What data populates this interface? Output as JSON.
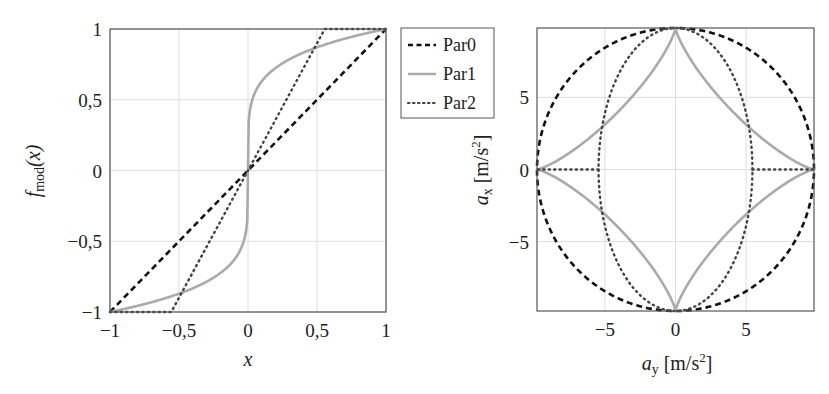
{
  "chart_data": [
    {
      "type": "line",
      "title": "",
      "xlabel": "x",
      "ylabel": "f_mod(x)",
      "xlim": [
        -1,
        1
      ],
      "ylim": [
        -1,
        1
      ],
      "grid": true,
      "xticks": [
        -1,
        -0.5,
        0,
        0.5,
        1
      ],
      "xtick_labels": [
        "−1",
        "−0,5",
        "0",
        "0,5",
        "1"
      ],
      "yticks": [
        -1,
        -0.5,
        0,
        0.5,
        1
      ],
      "ytick_labels": [
        "−1",
        "−0,5",
        "0",
        "0,5",
        "1"
      ],
      "series": [
        {
          "name": "Par0",
          "style": "dashed",
          "color": "#111111",
          "x": [
            -1,
            0,
            1
          ],
          "y": [
            -1,
            0,
            1
          ]
        },
        {
          "name": "Par1",
          "style": "solid",
          "color": "#aaaaaa",
          "x": [
            -1,
            -0.5,
            -0.1,
            -0.01,
            0,
            0.01,
            0.1,
            0.5,
            1
          ],
          "y": [
            -1,
            -0.87,
            -0.63,
            -0.4,
            0,
            0.4,
            0.63,
            0.87,
            1
          ]
        },
        {
          "name": "Par2",
          "style": "dotted",
          "color": "#444444",
          "x": [
            -1,
            -0.556,
            0.556,
            1
          ],
          "y": [
            -1,
            -1,
            1,
            1
          ]
        }
      ]
    },
    {
      "type": "line",
      "title": "",
      "xlabel": "a_y [m/s^2]",
      "ylabel": "a_x [m/s^2]",
      "xlim": [
        -9.81,
        9.81
      ],
      "ylim": [
        -9.81,
        9.81
      ],
      "grid": true,
      "xticks": [
        -5,
        0,
        5
      ],
      "xtick_labels": [
        "−5",
        "0",
        "5"
      ],
      "yticks": [
        -5,
        0,
        5
      ],
      "ytick_labels": [
        "−5",
        "0",
        "5"
      ],
      "series": [
        {
          "name": "Par0",
          "style": "dashed",
          "color": "#111111",
          "shape": "circle",
          "radius": 9.81
        },
        {
          "name": "Par1",
          "style": "solid",
          "color": "#aaaaaa",
          "shape": "superellipse",
          "radius": 9.81,
          "exponent": 0.78
        },
        {
          "name": "Par2",
          "style": "dotted",
          "color": "#444444",
          "shape": "ellipse_with_spurs",
          "semi_axis_y": 5.45,
          "semi_axis_x": 9.81,
          "spur_to": 9.81
        }
      ]
    }
  ],
  "legend": {
    "position": "between plots, top",
    "entries": [
      {
        "label": "Par0",
        "style": "dashed"
      },
      {
        "label": "Par1",
        "style": "solid"
      },
      {
        "label": "Par2",
        "style": "dotted"
      }
    ]
  },
  "labels": {
    "left_x": "x",
    "left_y_main": "f",
    "left_y_sub": "mod",
    "left_y_arg": "(x)",
    "right_x_main": "a",
    "right_x_sub": "y",
    "right_x_unit": "[m/s",
    "right_x_sup": "2",
    "right_x_close": "]",
    "right_y_main": "a",
    "right_y_sub": "x",
    "right_y_unit": "[m/s",
    "right_y_sup": "2",
    "right_y_close": "]"
  }
}
